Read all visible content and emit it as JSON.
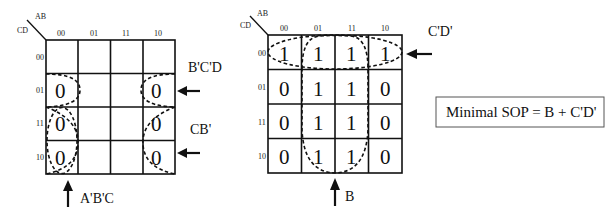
{
  "left_kmap": {
    "corner_col_var": "AB",
    "corner_row_var": "CD",
    "col_headers": [
      "00",
      "01",
      "11",
      "10"
    ],
    "row_headers": [
      "00",
      "01",
      "11",
      "10"
    ],
    "cells": [
      [
        "",
        "",
        "",
        ""
      ],
      [
        "0",
        "",
        "",
        "0"
      ],
      [
        "0",
        "",
        "",
        "0"
      ],
      [
        "0",
        "",
        "",
        "0"
      ]
    ],
    "annotations": {
      "top_right": "B'C'D",
      "middle_right": "CB'",
      "bottom": "A'B'C"
    }
  },
  "right_kmap": {
    "corner_col_var": "AB",
    "corner_row_var": "CD",
    "col_headers": [
      "00",
      "01",
      "11",
      "10"
    ],
    "row_headers": [
      "00",
      "01",
      "11",
      "10"
    ],
    "cells": [
      [
        "1",
        "1",
        "1",
        "1"
      ],
      [
        "0",
        "1",
        "1",
        "0"
      ],
      [
        "0",
        "1",
        "1",
        "0"
      ],
      [
        "0",
        "1",
        "1",
        "0"
      ]
    ],
    "annotations": {
      "top_right": "C'D'",
      "bottom": "B"
    }
  },
  "result": {
    "text": "Minimal SOP = B + C'D'"
  }
}
